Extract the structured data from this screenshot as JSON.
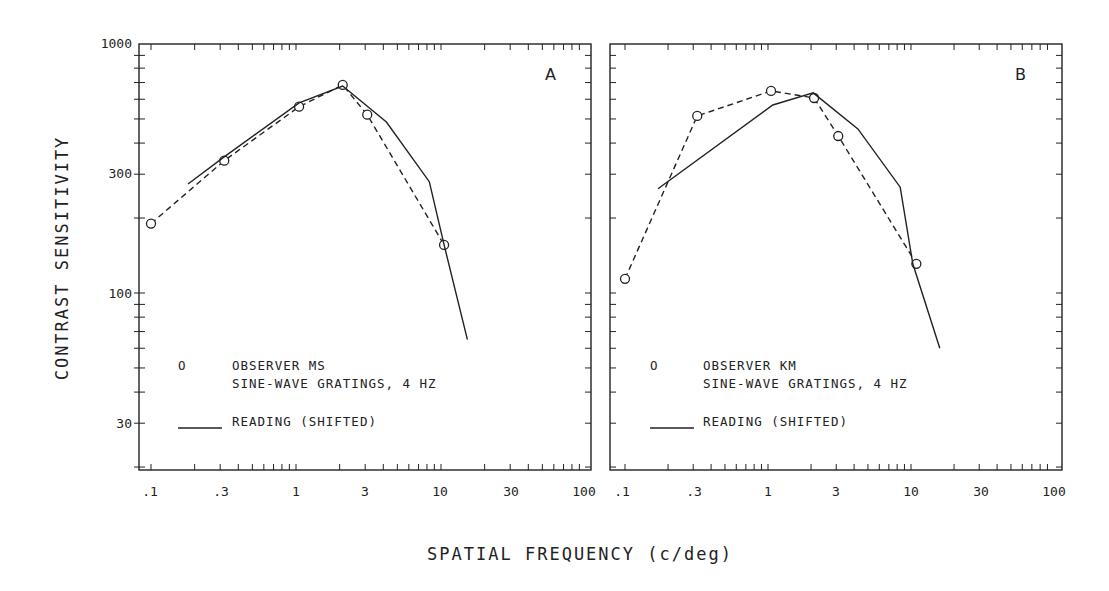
{
  "figure": {
    "y_axis_title": "CONTRAST SENSITIVITY",
    "x_axis_title": "SPATIAL FREQUENCY (c/deg)",
    "y_tick_labels": [
      "1000",
      "300",
      "100",
      "30"
    ],
    "x_tick_labels": [
      ".1",
      ".3",
      "1",
      "3",
      "10",
      "30",
      "100"
    ]
  },
  "panels": [
    {
      "letter": "A",
      "legend": {
        "marker_symbol": "O",
        "observer": "OBSERVER MS",
        "stimulus": "SINE-WAVE GRATINGS, 4 HZ",
        "line_label": "READING (SHIFTED)"
      }
    },
    {
      "letter": "B",
      "legend": {
        "marker_symbol": "O",
        "observer": "OBSERVER KM",
        "stimulus": "SINE-WAVE GRATINGS, 4 HZ",
        "line_label": "READING (SHIFTED)"
      }
    }
  ],
  "chart_data": [
    {
      "type": "line",
      "title": "A",
      "xlabel": "SPATIAL FREQUENCY (c/deg)",
      "ylabel": "CONTRAST SENSITIVITY",
      "xscale": "log",
      "yscale": "log",
      "xlim": [
        0.09,
        100
      ],
      "ylim": [
        19.5,
        1000
      ],
      "x_ticks": [
        0.1,
        0.3,
        1,
        3,
        10,
        30,
        100
      ],
      "y_ticks": [
        30,
        100,
        300,
        1000
      ],
      "grid": false,
      "legend_position": "lower-left inside",
      "series": [
        {
          "name": "OBSERVER MS — SINE-WAVE GRATINGS, 4 HZ",
          "style": "dashed with circle markers",
          "x": [
            0.1,
            0.32,
            1.05,
            2.1,
            3.1,
            10.5
          ],
          "y": [
            190,
            340,
            560,
            685,
            520,
            156
          ]
        },
        {
          "name": "READING (SHIFTED)",
          "style": "solid",
          "x": [
            0.18,
            0.32,
            1.05,
            2.1,
            4.2,
            8.3,
            10.5,
            15.2
          ],
          "y": [
            274,
            352,
            580,
            678,
            486,
            280,
            156,
            65
          ]
        }
      ]
    },
    {
      "type": "line",
      "title": "B",
      "xlabel": "SPATIAL FREQUENCY (c/deg)",
      "ylabel": "CONTRAST SENSITIVITY",
      "xscale": "log",
      "yscale": "log",
      "xlim": [
        0.09,
        100
      ],
      "ylim": [
        19.5,
        1000
      ],
      "x_ticks": [
        0.1,
        0.3,
        1,
        3,
        10,
        30,
        100
      ],
      "y_ticks": [
        30,
        100,
        300,
        1000
      ],
      "grid": false,
      "legend_position": "lower-left inside",
      "series": [
        {
          "name": "OBSERVER KM — SINE-WAVE GRATINGS, 4 HZ",
          "style": "dashed with circle markers",
          "x": [
            0.1,
            0.32,
            1.05,
            2.1,
            3.1,
            10.9
          ],
          "y": [
            114,
            514,
            648,
            607,
            427,
            131
          ]
        },
        {
          "name": "READING (SHIFTED)",
          "style": "solid",
          "x": [
            0.17,
            1.08,
            2.07,
            4.25,
            8.4,
            10.3,
            15.9
          ],
          "y": [
            262,
            569,
            636,
            456,
            266,
            131,
            60
          ]
        }
      ]
    }
  ]
}
